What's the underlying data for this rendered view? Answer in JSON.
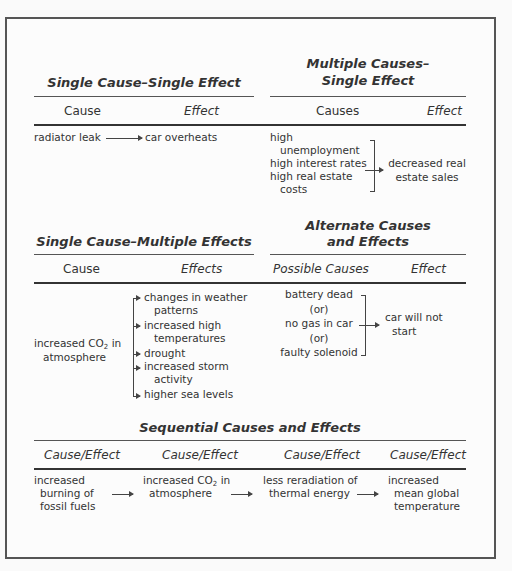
{
  "panels": {
    "single_single": {
      "title": "Single Cause–Single Effect",
      "headers": {
        "left": "Cause",
        "right": "Effect"
      },
      "cause": "radiator leak",
      "effect": "car overheats"
    },
    "multiple_single": {
      "title_line1": "Multiple Causes–",
      "title_line2": "Single Effect",
      "headers": {
        "left": "Causes",
        "right": "Effect"
      },
      "causes": [
        {
          "line1": "high",
          "line2": "unemployment"
        },
        {
          "line1": "high interest rates"
        },
        {
          "line1": "high real estate",
          "line2": "costs"
        }
      ],
      "effect_line1": "decreased real",
      "effect_line2": "estate sales"
    },
    "single_multiple": {
      "title": "Single Cause–Multiple Effects",
      "headers": {
        "left": "Cause",
        "right": "Effects"
      },
      "cause_line1_pre": "increased CO",
      "cause_line1_sub": "2",
      "cause_line1_post": " in",
      "cause_line2": "atmosphere",
      "effects": [
        {
          "line1": "changes in weather",
          "line2": "patterns"
        },
        {
          "line1": "increased high",
          "line2": "temperatures"
        },
        {
          "line1": "drought"
        },
        {
          "line1": "increased storm",
          "line2": "activity"
        },
        {
          "line1": "higher sea levels"
        }
      ]
    },
    "alternate": {
      "title_line1": "Alternate Causes",
      "title_line2": "and Effects",
      "headers": {
        "left": "Possible Causes",
        "right": "Effect"
      },
      "causes": [
        "battery dead",
        "(or)",
        "no gas in car",
        "(or)",
        "faulty solenoid"
      ],
      "effect_line1": "car will not",
      "effect_line2": "start"
    },
    "sequential": {
      "title": "Sequential Causes and Effects",
      "headers": [
        "Cause/Effect",
        "Cause/Effect",
        "Cause/Effect",
        "Cause/Effect"
      ],
      "steps": [
        {
          "line1": "increased",
          "line2": "burning of",
          "line3": "fossil fuels"
        },
        {
          "line1_pre": "increased CO",
          "line1_sub": "2",
          "line1_post": " in",
          "line2": "atmosphere"
        },
        {
          "line1": "less reradiation of",
          "line2": "thermal energy"
        },
        {
          "line1": "increased",
          "line2": "mean global",
          "line3": "temperature"
        }
      ]
    }
  }
}
